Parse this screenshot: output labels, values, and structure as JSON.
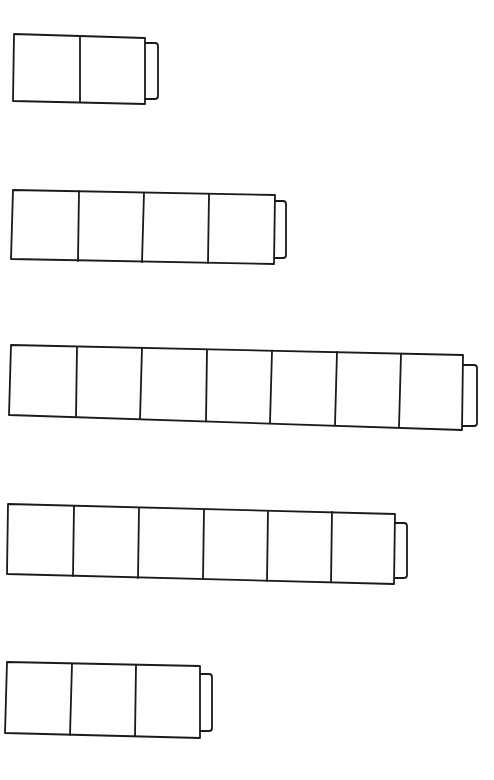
{
  "diagram": {
    "stroke_color": "#1a1a1a",
    "background": "#ffffff",
    "batteries": [
      {
        "id": "battery-1",
        "cells": 2,
        "body": {
          "tl": [
            14,
            34
          ],
          "tr": [
            145,
            38
          ],
          "br": [
            145,
            104
          ],
          "bl": [
            13,
            101
          ]
        },
        "dividers": [
          [
            80,
            36,
            80,
            102
          ]
        ],
        "terminal": {
          "x1": 145,
          "y1": 43,
          "x2": 158,
          "y2": 99
        }
      },
      {
        "id": "battery-2",
        "cells": 4,
        "body": {
          "tl": [
            13,
            190
          ],
          "tr": [
            275,
            195
          ],
          "br": [
            274,
            264
          ],
          "bl": [
            11,
            259
          ]
        },
        "dividers": [
          [
            79,
            191,
            78,
            261
          ],
          [
            144,
            193,
            142,
            262
          ],
          [
            209,
            194,
            208,
            263
          ]
        ],
        "terminal": {
          "x1": 275,
          "y1": 201,
          "x2": 286,
          "y2": 258
        }
      },
      {
        "id": "battery-3",
        "cells": 7,
        "body": {
          "tl": [
            11,
            345
          ],
          "tr": [
            463,
            355
          ],
          "br": [
            462,
            430
          ],
          "bl": [
            9,
            415
          ]
        },
        "dividers": [
          [
            77,
            347,
            76,
            417
          ],
          [
            142,
            348,
            140,
            419
          ],
          [
            207,
            350,
            206,
            421
          ],
          [
            272,
            351,
            270,
            423
          ],
          [
            337,
            352,
            335,
            425
          ],
          [
            401,
            354,
            399,
            427
          ]
        ],
        "terminal": {
          "x1": 463,
          "y1": 365,
          "x2": 477,
          "y2": 426
        }
      },
      {
        "id": "battery-4",
        "cells": 6,
        "body": {
          "tl": [
            8,
            504
          ],
          "tr": [
            395,
            514
          ],
          "br": [
            394,
            584
          ],
          "bl": [
            7,
            574
          ]
        },
        "dividers": [
          [
            74,
            506,
            73,
            576
          ],
          [
            139,
            508,
            138,
            578
          ],
          [
            204,
            510,
            203,
            579
          ],
          [
            268,
            511,
            267,
            581
          ],
          [
            332,
            512,
            331,
            582
          ]
        ],
        "terminal": {
          "x1": 395,
          "y1": 523,
          "x2": 407,
          "y2": 578
        }
      },
      {
        "id": "battery-5",
        "cells": 3,
        "body": {
          "tl": [
            7,
            662
          ],
          "tr": [
            200,
            666
          ],
          "br": [
            200,
            738
          ],
          "bl": [
            5,
            733
          ]
        },
        "dividers": [
          [
            72,
            664,
            70,
            735
          ],
          [
            136,
            665,
            135,
            736
          ]
        ],
        "terminal": {
          "x1": 200,
          "y1": 674,
          "x2": 212,
          "y2": 731
        }
      }
    ]
  }
}
